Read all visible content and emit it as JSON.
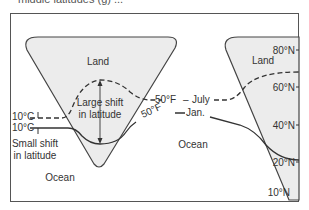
{
  "caption_fragment": "middle latitudes (g) ...",
  "diagram": {
    "labels": {
      "land_left": "Land",
      "land_right": "Land",
      "ocean_center": "Ocean",
      "ocean_left": "Ocean",
      "large_shift_1": "Large shift",
      "large_shift_2": "in latitude",
      "small_shift_1": "Small shift",
      "small_shift_2": "in latitude",
      "isotherm_july_c": "10°C",
      "isotherm_jan_c": "10°C",
      "isotherm_july_f": "50°F",
      "isotherm_jan_f": "50°F",
      "july": "July",
      "jan": "Jan."
    },
    "latitude_ticks": [
      "80°N",
      "60°N",
      "40°N",
      "20°N",
      "10°N"
    ],
    "colors": {
      "land_fill": "#ececec",
      "outline": "#444444",
      "text": "#333333"
    }
  }
}
